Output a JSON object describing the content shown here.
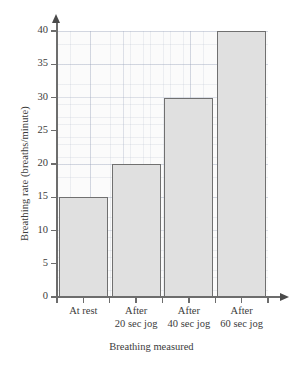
{
  "chart_data": {
    "type": "bar",
    "title": "",
    "xlabel": "Breathing measured",
    "ylabel": "Breathing rate (breaths/minute)",
    "categories": [
      "At rest",
      "After\n20 sec jog",
      "After\n40 sec jog",
      "After\n60 sec jog"
    ],
    "values": [
      15,
      20,
      30,
      40
    ],
    "ylim": [
      0,
      40
    ],
    "ytick_labels": [
      "0",
      "5",
      "10",
      "15",
      "20",
      "25",
      "30",
      "35",
      "40"
    ],
    "ytick_values": [
      0,
      5,
      10,
      15,
      20,
      25,
      30,
      35,
      40
    ],
    "grid": true,
    "legend": false,
    "bar_fill_color": "#e0e0e0",
    "bar_border_color": "#707070",
    "axis_color": "#6d6d6d",
    "plot_background_color": "#fbfbfb"
  }
}
